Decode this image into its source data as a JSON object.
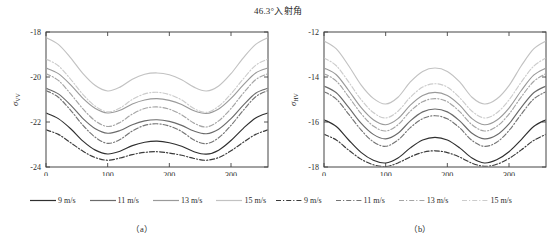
{
  "figure": {
    "title": "46.3°入射角",
    "caption_a": "（a）",
    "caption_b": "（b）"
  },
  "panels": [
    {
      "id": "a",
      "ylabel_main": "σ",
      "ylabel_sub": "VV",
      "xlabel": "风向/（°）",
      "yticks": [
        "-18",
        "-20",
        "-22",
        "-24"
      ],
      "xticks": [
        "0",
        "100",
        "200",
        "300"
      ]
    },
    {
      "id": "b",
      "ylabel_main": "σ",
      "ylabel_sub": "HV",
      "xlabel": "风向/（°）",
      "yticks": [
        "-12",
        "-14",
        "-16",
        "-18"
      ],
      "xticks": [
        "0",
        "100",
        "200",
        "300"
      ]
    }
  ],
  "legend": {
    "groups": [
      {
        "style": "solid",
        "items": [
          {
            "label": "9 m/s"
          },
          {
            "label": "11 m/s"
          },
          {
            "label": "13 m/s"
          },
          {
            "label": "15 m/s"
          }
        ]
      },
      {
        "style": "dashdot",
        "items": [
          {
            "label": "9 m/s"
          },
          {
            "label": "11 m/s"
          },
          {
            "label": "13 m/s"
          },
          {
            "label": "15 m/s"
          }
        ]
      }
    ]
  },
  "colors": {
    "axis": "#444444",
    "text": "#2b2b2b",
    "s9": "#2f2f2f",
    "s11": "#6b6b6b",
    "s13": "#9a9a9a",
    "s15": "#c2c2c2",
    "d9": "#3a3a3a",
    "d11": "#757575",
    "d13": "#a5a5a5",
    "d15": "#cccccc"
  },
  "chart_data": {
    "type": "line",
    "title": "46.3°入射角",
    "xlabel": "风向/（°）",
    "x": [
      0,
      20,
      40,
      60,
      80,
      100,
      120,
      140,
      160,
      180,
      200,
      220,
      240,
      260,
      280,
      300,
      320,
      340,
      360
    ],
    "xlim": [
      0,
      360
    ],
    "grid": false,
    "legend_position": "below",
    "panels": [
      {
        "id": "a",
        "caption": "（a）",
        "ylabel": "σVV",
        "ylim": [
          -24,
          -18
        ],
        "yticks": [
          -18,
          -20,
          -22,
          -24
        ],
        "series": [
          {
            "name": "9 m/s",
            "style": "solid",
            "color": "#2f2f2f",
            "values": [
              -21.6,
              -21.85,
              -22.3,
              -22.85,
              -23.25,
              -23.42,
              -23.3,
              -23.05,
              -22.9,
              -22.85,
              -22.92,
              -23.08,
              -23.32,
              -23.43,
              -23.25,
              -22.82,
              -22.28,
              -21.82,
              -21.6
            ]
          },
          {
            "name": "11 m/s",
            "style": "solid",
            "color": "#6b6b6b",
            "values": [
              -20.5,
              -20.75,
              -21.25,
              -21.85,
              -22.3,
              -22.5,
              -22.38,
              -22.12,
              -21.95,
              -21.9,
              -21.97,
              -22.15,
              -22.4,
              -22.52,
              -22.32,
              -21.85,
              -21.25,
              -20.72,
              -20.5
            ]
          },
          {
            "name": "13 m/s",
            "style": "solid",
            "color": "#9a9a9a",
            "values": [
              -19.6,
              -19.85,
              -20.35,
              -20.95,
              -21.4,
              -21.6,
              -21.48,
              -21.2,
              -21.02,
              -20.96,
              -21.04,
              -21.22,
              -21.5,
              -21.62,
              -21.42,
              -20.95,
              -20.35,
              -19.82,
              -19.6
            ]
          },
          {
            "name": "15 m/s",
            "style": "solid",
            "color": "#c2c2c2",
            "values": [
              -18.25,
              -18.55,
              -19.15,
              -19.85,
              -20.38,
              -20.62,
              -20.45,
              -20.1,
              -19.88,
              -19.82,
              -19.9,
              -20.12,
              -20.45,
              -20.62,
              -20.4,
              -19.85,
              -19.15,
              -18.55,
              -18.25
            ]
          },
          {
            "name": "9 m/s",
            "style": "dashdot",
            "color": "#3a3a3a",
            "values": [
              -22.35,
              -22.55,
              -22.92,
              -23.3,
              -23.58,
              -23.7,
              -23.6,
              -23.45,
              -23.35,
              -23.32,
              -23.38,
              -23.48,
              -23.62,
              -23.7,
              -23.58,
              -23.28,
              -22.9,
              -22.55,
              -22.35
            ]
          },
          {
            "name": "11 m/s",
            "style": "dashdot",
            "color": "#757575",
            "values": [
              -20.6,
              -20.9,
              -21.48,
              -22.15,
              -22.68,
              -22.95,
              -22.78,
              -22.4,
              -22.15,
              -22.08,
              -22.18,
              -22.42,
              -22.8,
              -22.96,
              -22.7,
              -22.15,
              -21.48,
              -20.88,
              -20.6
            ]
          },
          {
            "name": "13 m/s",
            "style": "dashdot",
            "color": "#a5a5a5",
            "values": [
              -19.85,
              -20.15,
              -20.75,
              -21.42,
              -21.95,
              -22.2,
              -22.02,
              -21.65,
              -21.4,
              -21.33,
              -21.43,
              -21.68,
              -22.05,
              -22.22,
              -21.95,
              -21.4,
              -20.72,
              -20.12,
              -19.85
            ]
          },
          {
            "name": "15 m/s",
            "style": "dashdot",
            "color": "#cccccc",
            "values": [
              -19.2,
              -19.5,
              -20.1,
              -20.78,
              -21.3,
              -21.55,
              -21.38,
              -21.0,
              -20.75,
              -20.68,
              -20.78,
              -21.02,
              -21.4,
              -21.57,
              -21.3,
              -20.75,
              -20.08,
              -19.48,
              -19.2
            ]
          }
        ]
      },
      {
        "id": "b",
        "caption": "（b）",
        "ylabel": "σHV",
        "ylim": [
          -18,
          -12
        ],
        "yticks": [
          -12,
          -14,
          -16,
          -18
        ],
        "series": [
          {
            "name": "9 m/s",
            "style": "solid",
            "color": "#2f2f2f",
            "values": [
              -15.9,
              -16.2,
              -16.8,
              -17.35,
              -17.7,
              -17.82,
              -17.6,
              -17.15,
              -16.8,
              -16.68,
              -16.8,
              -17.15,
              -17.6,
              -17.82,
              -17.68,
              -17.32,
              -16.78,
              -16.2,
              -15.9
            ]
          },
          {
            "name": "11 m/s",
            "style": "solid",
            "color": "#6b6b6b",
            "values": [
              -14.4,
              -14.7,
              -15.35,
              -16.05,
              -16.55,
              -16.75,
              -16.5,
              -15.95,
              -15.55,
              -15.42,
              -15.55,
              -15.95,
              -16.5,
              -16.75,
              -16.58,
              -16.08,
              -15.35,
              -14.7,
              -14.4
            ]
          },
          {
            "name": "13 m/s",
            "style": "solid",
            "color": "#9a9a9a",
            "values": [
              -13.6,
              -13.9,
              -14.6,
              -15.35,
              -15.9,
              -16.12,
              -15.85,
              -15.25,
              -14.82,
              -14.68,
              -14.82,
              -15.25,
              -15.85,
              -16.12,
              -15.92,
              -15.38,
              -14.6,
              -13.92,
              -13.6
            ]
          },
          {
            "name": "15 m/s",
            "style": "solid",
            "color": "#c2c2c2",
            "values": [
              -12.4,
              -12.75,
              -13.5,
              -14.35,
              -14.95,
              -15.2,
              -14.9,
              -14.22,
              -13.75,
              -13.6,
              -13.75,
              -14.22,
              -14.9,
              -15.2,
              -14.98,
              -14.38,
              -13.5,
              -12.75,
              -12.4
            ]
          },
          {
            "name": "9 m/s",
            "style": "dashdot",
            "color": "#3a3a3a",
            "values": [
              -16.55,
              -16.8,
              -17.25,
              -17.65,
              -17.9,
              -17.98,
              -17.82,
              -17.55,
              -17.35,
              -17.28,
              -17.36,
              -17.56,
              -17.83,
              -17.97,
              -17.88,
              -17.62,
              -17.24,
              -16.82,
              -16.55
            ]
          },
          {
            "name": "11 m/s",
            "style": "dashdot",
            "color": "#757575",
            "values": [
              -14.65,
              -14.98,
              -15.65,
              -16.35,
              -16.88,
              -17.08,
              -16.8,
              -16.25,
              -15.85,
              -15.72,
              -15.86,
              -16.26,
              -16.82,
              -17.08,
              -16.9,
              -16.38,
              -15.65,
              -14.98,
              -14.65
            ]
          },
          {
            "name": "13 m/s",
            "style": "dashdot",
            "color": "#a5a5a5",
            "values": [
              -13.85,
              -14.18,
              -14.88,
              -15.62,
              -16.18,
              -16.4,
              -16.12,
              -15.52,
              -15.1,
              -14.96,
              -15.1,
              -15.54,
              -16.12,
              -16.4,
              -16.2,
              -15.65,
              -14.88,
              -14.2,
              -13.85
            ]
          },
          {
            "name": "15 m/s",
            "style": "dashdot",
            "color": "#cccccc",
            "values": [
              -13.15,
              -13.5,
              -14.22,
              -15.0,
              -15.58,
              -15.82,
              -15.52,
              -14.9,
              -14.45,
              -14.3,
              -14.45,
              -14.92,
              -15.52,
              -15.82,
              -15.6,
              -15.02,
              -14.22,
              -13.52,
              -13.15
            ]
          }
        ]
      }
    ]
  }
}
